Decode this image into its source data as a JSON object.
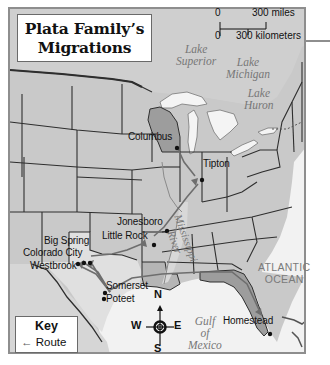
{
  "map": {
    "title_line1": "Plata Family’s",
    "title_line2": "Migrations",
    "scale": {
      "zero_top": "0",
      "miles_label": "300 miles",
      "zero_bottom": "0",
      "km_label": "300 kilometers"
    },
    "water_bodies": {
      "lake_superior": [
        "Lake",
        "Superior"
      ],
      "lake_michigan": [
        "Lake",
        "Michigan"
      ],
      "lake_huron": [
        "Lake",
        "Huron"
      ],
      "atlantic": [
        "ATLANTIC",
        "OCEAN"
      ],
      "gulf": [
        "Gulf",
        "of",
        "Mexico"
      ],
      "river": [
        "Mississippi",
        "River"
      ]
    },
    "cities": [
      {
        "name": "Columbus"
      },
      {
        "name": "Tipton"
      },
      {
        "name": "Jonesboro"
      },
      {
        "name": "Little Rock"
      },
      {
        "name": "Big Spring"
      },
      {
        "name": "Colorado City"
      },
      {
        "name": "Westbrook"
      },
      {
        "name": "Somerset"
      },
      {
        "name": "Poteet"
      },
      {
        "name": "Homestead"
      }
    ],
    "compass": {
      "n": "N",
      "s": "S",
      "e": "E",
      "w": "W"
    },
    "key": {
      "title": "Key",
      "route_arrow": "←",
      "route_label": "Route"
    },
    "colors": {
      "land": "#c9c9c9",
      "highlight_state": "#9d9d9d",
      "water": "#f2f2f2",
      "border": "#2e2e2e",
      "route": "#6e6e6e"
    }
  }
}
